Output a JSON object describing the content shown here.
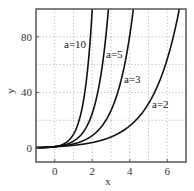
{
  "chart_data": {
    "type": "line",
    "title": "",
    "xlabel": "x",
    "ylabel": "y",
    "xlim": [
      -1,
      7
    ],
    "ylim": [
      -10,
      100
    ],
    "xticks": [
      0,
      2,
      4,
      6
    ],
    "yticks": [
      0,
      40,
      80
    ],
    "x_grid": [
      0,
      1,
      2,
      3,
      4,
      5,
      6
    ],
    "y_grid": [
      20,
      40,
      60,
      80
    ],
    "grid": true,
    "grid_style": "dotted",
    "function": "y = a^x",
    "series": [
      {
        "name": "a=10",
        "a": 10,
        "label_pos": [
          64,
          48
        ]
      },
      {
        "name": "a=5",
        "a": 5,
        "label_pos": [
          106,
          58
        ]
      },
      {
        "name": "a=3",
        "a": 3,
        "label_pos": [
          124,
          83
        ]
      },
      {
        "name": "a=2",
        "a": 2,
        "label_pos": [
          152,
          108
        ]
      }
    ],
    "sample_points": {
      "a=10": [
        [
          -1,
          0.1
        ],
        [
          0,
          1
        ],
        [
          1,
          10
        ],
        [
          2,
          100
        ]
      ],
      "a=5": [
        [
          -1,
          0.2
        ],
        [
          0,
          1
        ],
        [
          1,
          5
        ],
        [
          2,
          25
        ],
        [
          2.86,
          100
        ]
      ],
      "a=3": [
        [
          -1,
          0.33
        ],
        [
          0,
          1
        ],
        [
          1,
          3
        ],
        [
          2,
          9
        ],
        [
          3,
          27
        ],
        [
          4,
          81
        ],
        [
          4.19,
          100
        ]
      ],
      "a=2": [
        [
          -1,
          0.5
        ],
        [
          0,
          1
        ],
        [
          2,
          4
        ],
        [
          4,
          16
        ],
        [
          5,
          32
        ],
        [
          6,
          64
        ],
        [
          6.64,
          100
        ]
      ]
    },
    "colors": {
      "curve": "#111111",
      "frame": "#555555",
      "grid": "#aaaaaa"
    }
  }
}
